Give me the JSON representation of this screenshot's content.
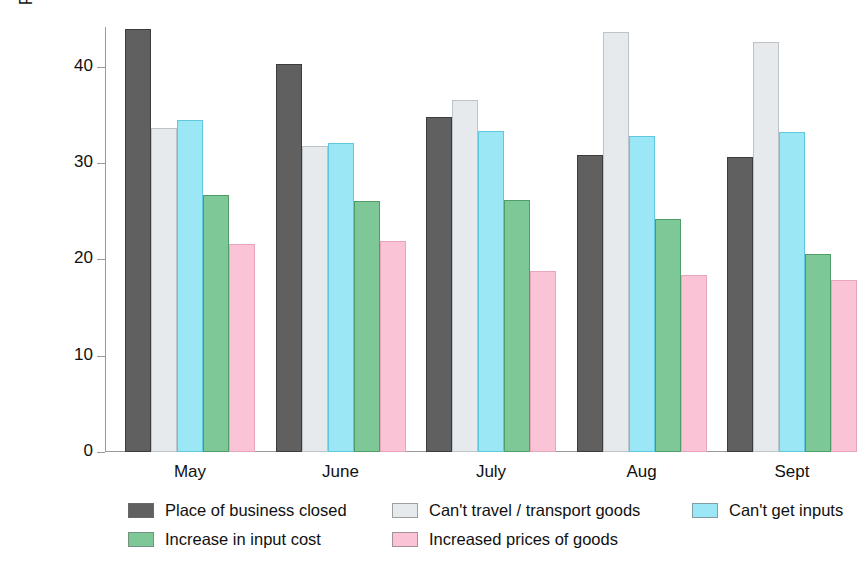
{
  "chart_data": {
    "type": "bar",
    "title": "",
    "subtitle": "",
    "xlabel": "",
    "ylabel": "Percentage of hhs reporting",
    "categories": [
      "May",
      "June",
      "July",
      "Aug",
      "Sept"
    ],
    "ylim": [
      0,
      44
    ],
    "yticks": [
      0,
      10,
      20,
      30,
      40
    ],
    "ytick_labels": [
      "0",
      "10",
      "20",
      "30",
      "40"
    ],
    "grid": false,
    "legend_position": "bottom",
    "series": [
      {
        "name": "Place of business closed",
        "color": "#606060",
        "values": [
          43.9,
          40.3,
          34.8,
          30.8,
          30.6
        ]
      },
      {
        "name": "Can't travel / transport goods",
        "color": "#e6eaec",
        "values": [
          33.6,
          31.8,
          36.5,
          43.6,
          42.5
        ]
      },
      {
        "name": "Can't get inputs",
        "color": "#9ce7f5",
        "values": [
          34.5,
          32.1,
          33.3,
          32.8,
          33.2
        ]
      },
      {
        "name": "Increase in input cost",
        "color": "#7ec898",
        "values": [
          26.7,
          26.1,
          26.2,
          24.2,
          20.5
        ]
      },
      {
        "name": "Increased prices of goods",
        "color": "#fac4d6",
        "values": [
          21.6,
          21.9,
          18.8,
          18.4,
          17.9
        ]
      }
    ]
  },
  "axis": {
    "y_title": "Percentage of hhs reporting",
    "y_tick_0": "0",
    "y_tick_1": "10",
    "y_tick_2": "20",
    "y_tick_3": "30",
    "y_tick_4": "40",
    "x_cat_0": "May",
    "x_cat_1": "June",
    "x_cat_2": "July",
    "x_cat_3": "Aug",
    "x_cat_4": "Sept"
  },
  "legend": {
    "items": [
      {
        "label": "Place of business closed",
        "color": "#606060"
      },
      {
        "label": "Can't travel / transport goods",
        "color": "#e6eaec"
      },
      {
        "label": "Can't get inputs",
        "color": "#9ce7f5"
      },
      {
        "label": "Increase in input cost",
        "color": "#7ec898"
      },
      {
        "label": "Increased prices of goods",
        "color": "#fac4d6"
      }
    ]
  }
}
